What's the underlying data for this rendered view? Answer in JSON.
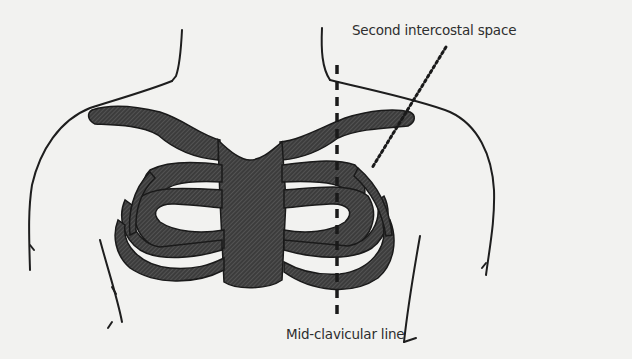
{
  "diagram": {
    "labels": {
      "second_intercostal_space": "Second intercostal space",
      "mid_clavicular_line": "Mid-clavicular line"
    },
    "colors": {
      "background": "#f2f2f0",
      "outline": "#1e1e1e",
      "bone_fill": "#3a3a3a",
      "label_text": "#2e2e2e"
    }
  }
}
